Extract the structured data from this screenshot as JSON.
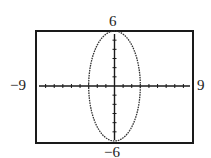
{
  "chart_data": {
    "type": "line",
    "title": "",
    "xlabel": "",
    "ylabel": "",
    "equation": "x^2/9 + y^2/36 = 1",
    "shape": "ellipse",
    "center": [
      0,
      0
    ],
    "semi_axis_x": 3,
    "semi_axis_y": 6,
    "xlim": [
      -9,
      9
    ],
    "ylim": [
      -6,
      6
    ],
    "xscale": 1,
    "yscale": 1,
    "grid": false,
    "series": [
      {
        "name": "ellipse",
        "x": [
          3,
          2.598,
          1.5,
          0,
          -1.5,
          -2.598,
          -3,
          -2.598,
          -1.5,
          0,
          1.5,
          2.598,
          3
        ],
        "y": [
          0,
          3,
          5.196,
          6,
          5.196,
          3,
          0,
          -3,
          -5.196,
          -6,
          -5.196,
          -3,
          0
        ]
      }
    ]
  },
  "window_labels": {
    "xmin": "−9",
    "xmax": "9",
    "ymin": "−6",
    "ymax": "6"
  },
  "colors": {
    "frame": "#1a1a1a",
    "axis": "#1a1a1a",
    "curve": "#333333"
  }
}
